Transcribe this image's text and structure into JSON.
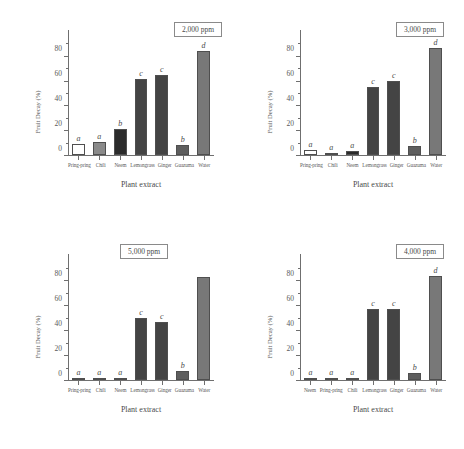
{
  "figure": {
    "xlabel": "Plant extract",
    "ylabel": "Fruit Decay (%)",
    "ytick_labels": [
      "0",
      "20",
      "40",
      "60",
      "80"
    ],
    "colors": {
      "white_bar": "#ffffff",
      "light_gray_bar": "#8a8a8a",
      "near_black_bar": "#2b2b2b",
      "dark_gray_bar": "#444444",
      "medium_gray_bar": "#787878",
      "axis": "#6f6f6f",
      "text": "#4a4a4a"
    }
  },
  "chart_data": [
    {
      "type": "bar",
      "title": "2,000 ppm",
      "panel": "top-left",
      "xlabel": "Plant extract",
      "ylabel": "Fruit Decay (%)",
      "ylim": [
        0,
        92
      ],
      "yticks": [
        0,
        20,
        40,
        60,
        80
      ],
      "grid": false,
      "legend": "none",
      "categories": [
        "Pring-pring",
        "Chili",
        "Neem",
        "Lemongrass",
        "Ginger",
        "Guazuma",
        "Water"
      ],
      "values": [
        9,
        11,
        21,
        62,
        65,
        8,
        85
      ],
      "annotations": [
        "a",
        "a",
        "b",
        "c",
        "c",
        "b",
        "d"
      ],
      "bar_colors": [
        "#ffffff",
        "#8a8a8a",
        "#2b2b2b",
        "#444444",
        "#444444",
        "#5e5e5e",
        "#787878"
      ]
    },
    {
      "type": "bar",
      "title": "3,000 ppm",
      "panel": "top-right",
      "xlabel": "Plant extract",
      "ylabel": "Fruit Decay (%)",
      "ylim": [
        0,
        92
      ],
      "yticks": [
        0,
        20,
        40,
        60,
        80
      ],
      "grid": false,
      "legend": "none",
      "categories": [
        "Pring-pring",
        "Chili",
        "Neem",
        "Lemongrass",
        "Ginger",
        "Guazuma",
        "Water"
      ],
      "values": [
        4,
        2,
        3,
        55,
        60,
        7,
        87
      ],
      "annotations": [
        "a",
        "a",
        "a",
        "c",
        "c",
        "b",
        "d"
      ],
      "bar_colors": [
        "#ffffff",
        "#8a8a8a",
        "#2b2b2b",
        "#444444",
        "#444444",
        "#5e5e5e",
        "#787878"
      ]
    },
    {
      "type": "bar",
      "title": "5,000 ppm",
      "panel": "bottom-left",
      "xlabel": "Plant extract",
      "ylabel": "Fruit Decay (%)",
      "ylim": [
        0,
        92
      ],
      "yticks": [
        0,
        20,
        40,
        60,
        80
      ],
      "grid": false,
      "legend": "none",
      "categories": [
        "Pring-pring",
        "Chili",
        "Neem",
        "Lemongrass",
        "Ginger",
        "Guazuma",
        "Water"
      ],
      "values": [
        1,
        1,
        1,
        50,
        47,
        7,
        83
      ],
      "annotations": [
        "a",
        "a",
        "a",
        "c",
        "c",
        "b",
        ""
      ],
      "bar_colors": [
        "#ffffff",
        "#8a8a8a",
        "#2b2b2b",
        "#444444",
        "#444444",
        "#5e5e5e",
        "#787878"
      ]
    },
    {
      "type": "bar",
      "title": "4,000 ppm",
      "panel": "bottom-right",
      "xlabel": "Plant extract",
      "ylabel": "Fruit Decay (%)",
      "ylim": [
        0,
        92
      ],
      "yticks": [
        0,
        20,
        40,
        60,
        80
      ],
      "grid": false,
      "legend": "none",
      "categories": [
        "Neem",
        "Pring-pring",
        "Chili",
        "Lemongrass",
        "Ginger",
        "Guazuma",
        "Water"
      ],
      "values": [
        1,
        1,
        2,
        57,
        57,
        6,
        84
      ],
      "annotations": [
        "a",
        "a",
        "a",
        "c",
        "c",
        "b",
        "d"
      ],
      "bar_colors": [
        "#ffffff",
        "#8a8a8a",
        "#2b2b2b",
        "#444444",
        "#444444",
        "#5e5e5e",
        "#787878"
      ]
    }
  ]
}
